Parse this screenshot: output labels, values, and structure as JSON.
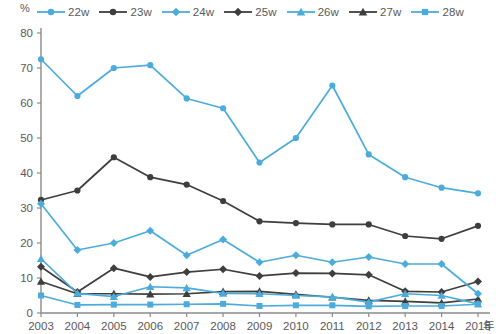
{
  "chart_data": {
    "type": "line",
    "title": "",
    "xlabel": "年",
    "ylabel": "%",
    "x": [
      2003,
      2004,
      2005,
      2006,
      2007,
      2008,
      2009,
      2010,
      2011,
      2012,
      2013,
      2014,
      2015
    ],
    "xtick_labels": [
      "2003",
      "2004",
      "2005",
      "2006",
      "2007",
      "2008",
      "2009",
      "2010",
      "2011",
      "2012",
      "2013",
      "2014",
      "2015"
    ],
    "ytick_labels": [
      "0",
      "10",
      "20",
      "30",
      "40",
      "50",
      "60",
      "70",
      "80"
    ],
    "ylim": [
      0,
      80
    ],
    "ytick_step": 10,
    "grid": false,
    "legend_position": "top",
    "series": [
      {
        "name": "22w",
        "color": "#4BACDC",
        "marker": "circle",
        "values": [
          72.5,
          62.0,
          70.0,
          70.8,
          61.3,
          58.5,
          43.0,
          50.0,
          65.0,
          45.3,
          38.8,
          35.8,
          34.2
        ]
      },
      {
        "name": "23w",
        "color": "#3E3E3E",
        "marker": "circle",
        "values": [
          32.3,
          35.0,
          44.5,
          38.8,
          36.7,
          32.0,
          26.2,
          25.7,
          25.3,
          25.3,
          22.0,
          21.2,
          24.9
        ]
      },
      {
        "name": "24w",
        "color": "#4BACDC",
        "marker": "diamond",
        "values": [
          31.2,
          18.0,
          20.0,
          23.5,
          16.5,
          21.0,
          14.5,
          16.5,
          14.5,
          16.0,
          14.0,
          14.0,
          5.5
        ]
      },
      {
        "name": "25w",
        "color": "#3E3E3E",
        "marker": "diamond",
        "values": [
          13.2,
          6.0,
          12.8,
          10.3,
          11.7,
          12.5,
          10.6,
          11.4,
          11.3,
          10.9,
          6.2,
          6.0,
          9.0
        ]
      },
      {
        "name": "26w",
        "color": "#4BACDC",
        "marker": "triangle",
        "values": [
          15.5,
          5.6,
          4.7,
          7.5,
          7.2,
          5.6,
          5.5,
          5.0,
          4.6,
          3.1,
          5.5,
          5.0,
          2.6
        ]
      },
      {
        "name": "27w",
        "color": "#3E3E3E",
        "marker": "triangle",
        "values": [
          9.0,
          5.5,
          5.5,
          5.4,
          5.5,
          6.1,
          6.2,
          5.3,
          4.5,
          3.6,
          3.3,
          2.9,
          4.0
        ]
      },
      {
        "name": "28w",
        "color": "#4BACDC",
        "marker": "square",
        "values": [
          5.0,
          2.3,
          2.4,
          2.4,
          2.5,
          2.6,
          2.0,
          2.2,
          2.2,
          1.9,
          2.0,
          2.0,
          2.5
        ]
      }
    ]
  }
}
